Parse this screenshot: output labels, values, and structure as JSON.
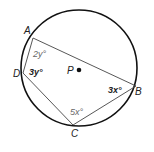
{
  "diagram": {
    "type": "inscribed-quadrilateral",
    "circle": {
      "center_label": "P",
      "cx": 79,
      "cy": 68,
      "r": 58
    },
    "vertices": [
      {
        "label": "A",
        "x": 33,
        "y": 38
      },
      {
        "label": "B",
        "x": 136,
        "y": 86
      },
      {
        "label": "C",
        "x": 73,
        "y": 125
      },
      {
        "label": "D",
        "x": 23,
        "y": 73
      }
    ],
    "angles": [
      {
        "id": "angle-A",
        "text": "2y°"
      },
      {
        "id": "angle-D",
        "text": "3y°"
      },
      {
        "id": "angle-B",
        "text": "3x°"
      },
      {
        "id": "angle-C",
        "text": "5x°"
      }
    ],
    "colors": {
      "stroke": "#222222",
      "circle": "#111111",
      "light_text": "#666666"
    }
  }
}
